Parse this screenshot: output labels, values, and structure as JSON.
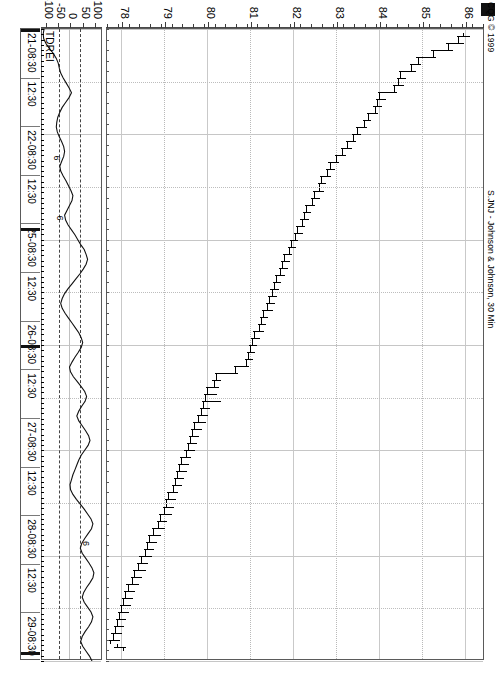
{
  "header": {
    "copyright": "CQG © 1999",
    "title": "S.JNJ - Johnson & Johnson, 30 Min"
  },
  "indicator": {
    "label": "TDREI"
  },
  "price_axis": {
    "labels": [
      "86",
      "85",
      "84",
      "83",
      "82",
      "81",
      "80",
      "79",
      "78"
    ],
    "min": 77.6,
    "max": 86.4
  },
  "indicator_axis": {
    "labels": [
      "100",
      "50",
      "0",
      "-50",
      "-100"
    ],
    "min": -125,
    "max": 125
  },
  "time_axis": {
    "labels": [
      "21-08:30",
      "12:30",
      "22-08:30",
      "12:30",
      "25-08:30",
      "12:30",
      "26-08:30",
      "12:30",
      "27-08:30",
      "12:30",
      "28-08:30",
      "12:30",
      "29-08:30"
    ]
  },
  "annotations": [
    {
      "text": "6",
      "t": 0.205,
      "v": -55
    },
    {
      "text": "6",
      "t": 0.3,
      "v": -42
    },
    {
      "text": "6",
      "t": 0.815,
      "v": 62
    }
  ],
  "chart_data": {
    "type": "line",
    "title": "S.JNJ - Johnson & Johnson, 30 Min",
    "subtitle": "CQG © 1999",
    "xlabel": "",
    "ylabel": "",
    "grid": true,
    "legend": "none",
    "panes": [
      {
        "name": "price",
        "type": "ohlc",
        "ylim": [
          77.6,
          86.4
        ],
        "yticks": [
          86,
          85,
          84,
          83,
          82,
          81,
          80,
          79,
          78
        ],
        "bars": [
          {
            "o": 85.95,
            "h": 86.1,
            "l": 85.8,
            "c": 85.85
          },
          {
            "o": 85.85,
            "h": 85.95,
            "l": 85.55,
            "c": 85.6
          },
          {
            "o": 85.6,
            "h": 85.7,
            "l": 85.2,
            "c": 85.25
          },
          {
            "o": 85.25,
            "h": 85.3,
            "l": 84.85,
            "c": 84.9
          },
          {
            "o": 84.9,
            "h": 84.95,
            "l": 84.7,
            "c": 84.75
          },
          {
            "o": 84.75,
            "h": 84.85,
            "l": 84.45,
            "c": 84.5
          },
          {
            "o": 84.5,
            "h": 84.6,
            "l": 84.4,
            "c": 84.45
          },
          {
            "o": 84.45,
            "h": 84.55,
            "l": 84.3,
            "c": 84.35
          },
          {
            "o": 84.35,
            "h": 84.4,
            "l": 83.95,
            "c": 84.0
          },
          {
            "o": 84.0,
            "h": 84.15,
            "l": 83.9,
            "c": 83.95
          },
          {
            "o": 83.95,
            "h": 84.05,
            "l": 83.85,
            "c": 83.9
          },
          {
            "o": 83.9,
            "h": 83.95,
            "l": 83.7,
            "c": 83.75
          },
          {
            "o": 83.75,
            "h": 83.8,
            "l": 83.6,
            "c": 83.65
          },
          {
            "o": 83.65,
            "h": 83.7,
            "l": 83.45,
            "c": 83.5
          },
          {
            "o": 83.5,
            "h": 83.55,
            "l": 83.35,
            "c": 83.4
          },
          {
            "o": 83.4,
            "h": 83.45,
            "l": 83.2,
            "c": 83.25
          },
          {
            "o": 83.25,
            "h": 83.35,
            "l": 83.1,
            "c": 83.15
          },
          {
            "o": 83.15,
            "h": 83.2,
            "l": 82.95,
            "c": 83.0
          },
          {
            "o": 83.0,
            "h": 83.05,
            "l": 82.8,
            "c": 82.85
          },
          {
            "o": 82.85,
            "h": 82.95,
            "l": 82.75,
            "c": 82.8
          },
          {
            "o": 82.8,
            "h": 82.85,
            "l": 82.6,
            "c": 82.65
          },
          {
            "o": 82.65,
            "h": 82.75,
            "l": 82.55,
            "c": 82.6
          },
          {
            "o": 82.6,
            "h": 82.7,
            "l": 82.45,
            "c": 82.5
          },
          {
            "o": 82.5,
            "h": 82.6,
            "l": 82.4,
            "c": 82.45
          },
          {
            "o": 82.45,
            "h": 82.5,
            "l": 82.25,
            "c": 82.3
          },
          {
            "o": 82.3,
            "h": 82.4,
            "l": 82.2,
            "c": 82.25
          },
          {
            "o": 82.25,
            "h": 82.35,
            "l": 82.15,
            "c": 82.2
          },
          {
            "o": 82.2,
            "h": 82.25,
            "l": 82.05,
            "c": 82.1
          },
          {
            "o": 82.1,
            "h": 82.2,
            "l": 82.0,
            "c": 82.05
          },
          {
            "o": 82.05,
            "h": 82.1,
            "l": 81.9,
            "c": 81.95
          },
          {
            "o": 81.95,
            "h": 82.05,
            "l": 81.85,
            "c": 81.9
          },
          {
            "o": 81.9,
            "h": 81.95,
            "l": 81.75,
            "c": 81.8
          },
          {
            "o": 81.8,
            "h": 81.9,
            "l": 81.7,
            "c": 81.75
          },
          {
            "o": 81.75,
            "h": 81.85,
            "l": 81.65,
            "c": 81.7
          },
          {
            "o": 81.7,
            "h": 81.8,
            "l": 81.55,
            "c": 81.6
          },
          {
            "o": 81.6,
            "h": 81.7,
            "l": 81.5,
            "c": 81.55
          },
          {
            "o": 81.55,
            "h": 81.65,
            "l": 81.45,
            "c": 81.5
          },
          {
            "o": 81.5,
            "h": 81.6,
            "l": 81.4,
            "c": 81.45
          },
          {
            "o": 81.45,
            "h": 81.55,
            "l": 81.35,
            "c": 81.4
          },
          {
            "o": 81.4,
            "h": 81.5,
            "l": 81.25,
            "c": 81.3
          },
          {
            "o": 81.3,
            "h": 81.4,
            "l": 81.2,
            "c": 81.25
          },
          {
            "o": 81.25,
            "h": 81.35,
            "l": 81.15,
            "c": 81.2
          },
          {
            "o": 81.2,
            "h": 81.3,
            "l": 81.05,
            "c": 81.1
          },
          {
            "o": 81.1,
            "h": 81.2,
            "l": 81.0,
            "c": 81.05
          },
          {
            "o": 81.05,
            "h": 81.15,
            "l": 80.95,
            "c": 81.0
          },
          {
            "o": 81.0,
            "h": 81.1,
            "l": 80.9,
            "c": 80.95
          },
          {
            "o": 80.95,
            "h": 81.05,
            "l": 80.85,
            "c": 80.9
          },
          {
            "o": 80.9,
            "h": 80.95,
            "l": 80.6,
            "c": 80.65
          },
          {
            "o": 80.65,
            "h": 80.7,
            "l": 80.15,
            "c": 80.2
          },
          {
            "o": 80.2,
            "h": 80.3,
            "l": 80.1,
            "c": 80.15
          },
          {
            "o": 80.15,
            "h": 80.25,
            "l": 79.95,
            "c": 80.0
          },
          {
            "o": 80.0,
            "h": 80.2,
            "l": 79.9,
            "c": 79.95
          },
          {
            "o": 79.95,
            "h": 80.3,
            "l": 79.85,
            "c": 79.9
          },
          {
            "o": 79.9,
            "h": 80.05,
            "l": 79.8,
            "c": 79.85
          },
          {
            "o": 79.85,
            "h": 80.0,
            "l": 79.75,
            "c": 79.8
          },
          {
            "o": 79.8,
            "h": 79.95,
            "l": 79.65,
            "c": 79.7
          },
          {
            "o": 79.7,
            "h": 79.85,
            "l": 79.6,
            "c": 79.65
          },
          {
            "o": 79.65,
            "h": 79.8,
            "l": 79.55,
            "c": 79.6
          },
          {
            "o": 79.6,
            "h": 79.75,
            "l": 79.5,
            "c": 79.55
          },
          {
            "o": 79.55,
            "h": 79.7,
            "l": 79.45,
            "c": 79.5
          },
          {
            "o": 79.5,
            "h": 79.6,
            "l": 79.35,
            "c": 79.4
          },
          {
            "o": 79.4,
            "h": 79.55,
            "l": 79.3,
            "c": 79.35
          },
          {
            "o": 79.35,
            "h": 79.5,
            "l": 79.25,
            "c": 79.3
          },
          {
            "o": 79.3,
            "h": 79.45,
            "l": 79.2,
            "c": 79.25
          },
          {
            "o": 79.25,
            "h": 79.4,
            "l": 79.15,
            "c": 79.2
          },
          {
            "o": 79.2,
            "h": 79.3,
            "l": 79.05,
            "c": 79.1
          },
          {
            "o": 79.1,
            "h": 79.25,
            "l": 79.0,
            "c": 79.05
          },
          {
            "o": 79.05,
            "h": 79.2,
            "l": 78.95,
            "c": 79.0
          },
          {
            "o": 79.0,
            "h": 79.15,
            "l": 78.85,
            "c": 78.9
          },
          {
            "o": 78.9,
            "h": 79.05,
            "l": 78.8,
            "c": 78.85
          },
          {
            "o": 78.85,
            "h": 79.0,
            "l": 78.7,
            "c": 78.75
          },
          {
            "o": 78.75,
            "h": 78.9,
            "l": 78.6,
            "c": 78.65
          },
          {
            "o": 78.65,
            "h": 78.8,
            "l": 78.55,
            "c": 78.6
          },
          {
            "o": 78.6,
            "h": 78.75,
            "l": 78.5,
            "c": 78.55
          },
          {
            "o": 78.55,
            "h": 78.7,
            "l": 78.4,
            "c": 78.45
          },
          {
            "o": 78.45,
            "h": 78.6,
            "l": 78.35,
            "c": 78.4
          },
          {
            "o": 78.4,
            "h": 78.55,
            "l": 78.25,
            "c": 78.3
          },
          {
            "o": 78.3,
            "h": 78.45,
            "l": 78.2,
            "c": 78.25
          },
          {
            "o": 78.25,
            "h": 78.4,
            "l": 78.1,
            "c": 78.15
          },
          {
            "o": 78.15,
            "h": 78.3,
            "l": 78.05,
            "c": 78.1
          },
          {
            "o": 78.1,
            "h": 78.25,
            "l": 78.0,
            "c": 78.05
          },
          {
            "o": 78.05,
            "h": 78.2,
            "l": 77.95,
            "c": 78.0
          },
          {
            "o": 78.0,
            "h": 78.15,
            "l": 77.9,
            "c": 77.95
          },
          {
            "o": 77.95,
            "h": 78.1,
            "l": 77.85,
            "c": 77.9
          },
          {
            "o": 77.9,
            "h": 78.05,
            "l": 77.8,
            "c": 77.85
          },
          {
            "o": 77.85,
            "h": 78.0,
            "l": 77.75,
            "c": 77.8
          },
          {
            "o": 77.8,
            "h": 77.95,
            "l": 77.7,
            "c": 77.75
          },
          {
            "o": 77.9,
            "h": 78.1,
            "l": 77.8,
            "c": 78.05
          }
        ]
      },
      {
        "name": "TDREI",
        "type": "line",
        "ylim": [
          -125,
          125
        ],
        "yticks": [
          100,
          50,
          0,
          -50,
          -100
        ],
        "reference_lines": [
          45,
          -45
        ],
        "values": [
          -108,
          -112,
          -110,
          -100,
          -86,
          -70,
          -58,
          -50,
          -46,
          -40,
          -30,
          -18,
          -6,
          4,
          -6,
          -20,
          -34,
          -44,
          -52,
          -56,
          -58,
          -54,
          -46,
          -36,
          -28,
          -24,
          -28,
          -36,
          -44,
          -40,
          -30,
          -18,
          -8,
          2,
          10,
          6,
          -4,
          -14,
          -24,
          -20,
          -10,
          4,
          18,
          30,
          42,
          56,
          64,
          70,
          64,
          52,
          38,
          22,
          6,
          -10,
          -24,
          -34,
          -40,
          -34,
          -22,
          -8,
          6,
          20,
          34,
          44,
          50,
          44,
          32,
          18,
          6,
          -4,
          0,
          12,
          28,
          44,
          58,
          66,
          60,
          46,
          34,
          26,
          34,
          48,
          62,
          74,
          80,
          72,
          58,
          44,
          34,
          26,
          18,
          10,
          4,
          -2,
          0,
          10,
          24,
          40,
          56,
          70,
          84,
          92,
          86,
          72,
          58,
          46,
          40,
          48,
          62,
          76,
          88,
          96,
          92,
          80,
          66,
          54,
          48,
          56,
          70,
          84,
          92,
          86,
          74,
          60,
          48,
          42,
          50,
          64,
          78,
          88
        ]
      }
    ]
  }
}
